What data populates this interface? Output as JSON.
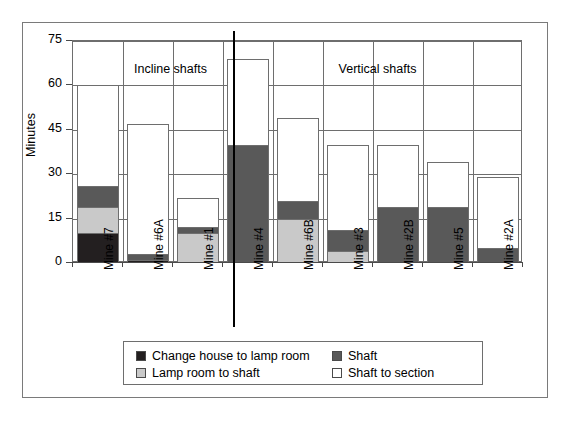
{
  "chart_data": {
    "type": "bar",
    "subtype": "stacked-bar",
    "title": "",
    "xlabel": "",
    "ylabel": "Minutes",
    "ylim": [
      0,
      75
    ],
    "yticks": [
      0,
      15,
      30,
      45,
      60,
      75
    ],
    "grid": true,
    "legend_position": "bottom",
    "categories": [
      "Mine #7",
      "Mine #6A",
      "Mine #1",
      "Mine #4",
      "Mine #6B",
      "Mine #3",
      "Mine #2B",
      "Mine #5",
      "Mine #2A"
    ],
    "series": [
      {
        "name": "Change house to lamp room",
        "color": "#231f20",
        "values": [
          10,
          1,
          0,
          0,
          0,
          0,
          0,
          0,
          0
        ]
      },
      {
        "name": "Lamp room to shaft",
        "color": "#c9c9c9",
        "values": [
          9,
          0,
          10,
          0,
          15,
          4,
          0,
          0,
          0
        ]
      },
      {
        "name": "Shaft",
        "color": "#595959",
        "values": [
          7,
          2,
          2,
          40,
          6,
          7,
          19,
          19,
          5
        ]
      },
      {
        "name": "Shaft to section",
        "color": "#ffffff",
        "values": [
          34,
          44,
          10,
          29,
          28,
          29,
          21,
          15,
          24
        ]
      }
    ],
    "totals": [
      60,
      47,
      22,
      69,
      49,
      40,
      40,
      34,
      29
    ],
    "groups": [
      {
        "label": "Incline shafts",
        "categories": [
          "Mine #7",
          "Mine #6A",
          "Mine #1"
        ]
      },
      {
        "label": "Vertical shafts",
        "categories": [
          "Mine #4",
          "Mine #6B",
          "Mine #3",
          "Mine #2B",
          "Mine #5",
          "Mine #2A"
        ]
      }
    ],
    "legend_entries": [
      {
        "label": "Change house to lamp room",
        "color": "#231f20"
      },
      {
        "label": "Shaft",
        "color": "#595959"
      },
      {
        "label": "Lamp room to shaft",
        "color": "#c9c9c9"
      },
      {
        "label": "Shaft to section",
        "color": "#ffffff"
      }
    ]
  }
}
